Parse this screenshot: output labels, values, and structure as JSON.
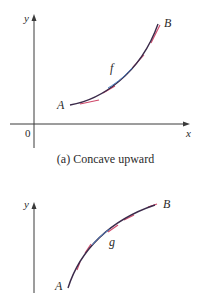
{
  "figure_a": {
    "caption": "(a) Concave upward",
    "y_axis_label": "y",
    "x_axis_label": "x",
    "origin_label": "0",
    "curve_label": "f",
    "start_point_label": "A",
    "end_point_label": "B"
  },
  "figure_b": {
    "y_axis_label": "y",
    "curve_label": "g",
    "start_point_label": "A",
    "end_point_label": "B"
  },
  "colors": {
    "axis": "#3a3a3a",
    "curve": "#3b2a4a",
    "curve_highlight": "#4a7fc0",
    "tangent": "#d0486a",
    "text": "#2a2a2a"
  }
}
